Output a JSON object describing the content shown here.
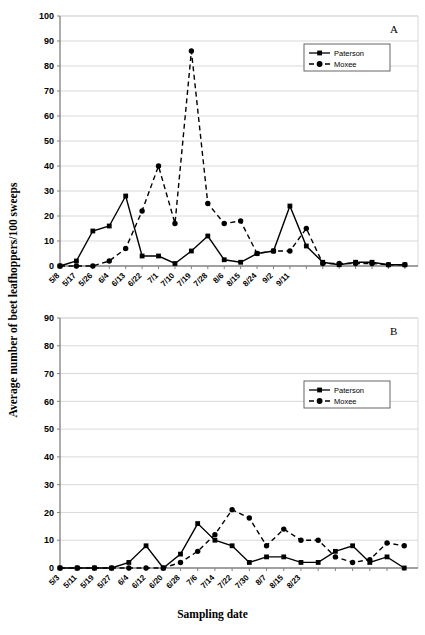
{
  "axis_titles": {
    "y": "Average number of beet leafhoppers/100 sweeps",
    "x": "Sampling date"
  },
  "legend": {
    "paterson": "Paterson",
    "moxee": "Moxee"
  },
  "panel_labels": {
    "a": "A",
    "b": "B"
  },
  "chart_data": [
    {
      "type": "line",
      "panel": "A",
      "title": "A",
      "xlabel": "Sampling date",
      "ylabel": "Average number of beet leafhoppers/100 sweeps",
      "ylim": [
        0,
        100
      ],
      "ytick_labels": [
        "0",
        "10",
        "20",
        "30",
        "40",
        "50",
        "60",
        "70",
        "80",
        "90",
        "100"
      ],
      "yticks": [
        0,
        10,
        20,
        30,
        40,
        50,
        60,
        70,
        80,
        90,
        100
      ],
      "grid": true,
      "legend_position": "upper-right-inside",
      "categories": [
        "5/8",
        "5/17",
        "5/26",
        "6/4",
        "6/13",
        "6/22",
        "7/1",
        "7/10",
        "7/19",
        "7/28",
        "8/6",
        "8/15",
        "8/24",
        "9/2",
        "9/11"
      ],
      "x": [
        0,
        1,
        2,
        3,
        4,
        5,
        6,
        7,
        8,
        9,
        10,
        11,
        12,
        13,
        14,
        15,
        16,
        17
      ],
      "series": [
        {
          "name": "Paterson",
          "marker": "square",
          "line": "solid",
          "values": [
            0,
            2,
            14,
            16,
            28,
            4,
            4,
            1,
            6,
            12,
            2.5,
            1.5,
            5,
            6,
            24,
            8,
            1.5,
            0.5,
            1.5,
            1.5,
            0.5,
            0.5
          ]
        },
        {
          "name": "Moxee",
          "marker": "circle",
          "line": "dashed",
          "values": [
            0,
            0,
            0,
            2,
            7,
            22,
            40,
            17,
            86,
            25,
            17,
            18,
            5,
            6,
            6,
            15,
            1,
            1,
            1,
            1,
            0.5,
            0.5
          ]
        }
      ]
    },
    {
      "type": "line",
      "panel": "B",
      "title": "B",
      "xlabel": "Sampling date",
      "ylabel": "Average number of beet leafhoppers/100 sweeps",
      "ylim": [
        0,
        90
      ],
      "ytick_labels": [
        "0",
        "10",
        "20",
        "30",
        "40",
        "50",
        "60",
        "70",
        "80",
        "90"
      ],
      "yticks": [
        0,
        10,
        20,
        30,
        40,
        50,
        60,
        70,
        80,
        90
      ],
      "grid": true,
      "legend_position": "upper-right-inside",
      "categories": [
        "5/3",
        "5/11",
        "5/19",
        "5/27",
        "6/4",
        "6/12",
        "6/20",
        "6/28",
        "7/6",
        "7/14",
        "7/22",
        "7/30",
        "8/7",
        "8/15",
        "8/23"
      ],
      "x": [
        0,
        1,
        2,
        3,
        4,
        5,
        6,
        7,
        8,
        9,
        10,
        11,
        12,
        13,
        14,
        15,
        16,
        17
      ],
      "series": [
        {
          "name": "Paterson",
          "marker": "square",
          "line": "solid",
          "values": [
            0,
            0,
            0,
            0,
            2,
            8,
            0,
            5,
            16,
            10,
            8,
            2,
            4,
            4,
            2,
            2,
            6,
            8,
            2,
            4,
            0
          ]
        },
        {
          "name": "Moxee",
          "marker": "circle",
          "line": "dashed",
          "values": [
            0,
            0,
            0,
            0,
            0,
            0,
            0,
            2,
            6,
            12,
            21,
            18,
            8,
            14,
            10,
            10,
            4,
            2,
            3,
            9,
            8
          ]
        }
      ]
    }
  ]
}
